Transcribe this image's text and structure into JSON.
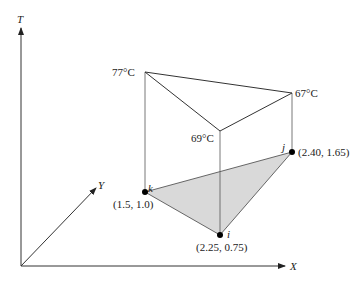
{
  "diagram": {
    "type": "3d-temperature-surface",
    "axes": {
      "t_label": "T",
      "x_label": "X",
      "y_label": "Y"
    },
    "nodes": [
      {
        "id": "k",
        "label": "k",
        "coords": "(1.5, 1.0)",
        "temperature": "77°C"
      },
      {
        "id": "i",
        "label": "i",
        "coords": "(2.25, 0.75)",
        "temperature": "69°C"
      },
      {
        "id": "j",
        "label": "j",
        "coords": "(2.40, 1.65)",
        "temperature": "67°C"
      }
    ],
    "colors": {
      "line": "#333333",
      "triangle_fill": "#d9d9d9",
      "node": "#000000"
    }
  }
}
